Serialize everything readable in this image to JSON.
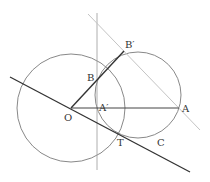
{
  "diagram": {
    "colors": {
      "thin_line": "#8a8a8a",
      "light_line": "#c4c4c4",
      "thick_line": "#333333",
      "circle": "#7a7a7a",
      "label": "#333333"
    },
    "points": {
      "O": {
        "label": "O",
        "x": 71,
        "y": 108
      },
      "A": {
        "label": "A",
        "x": 179,
        "y": 108
      },
      "A_prime": {
        "label": "A′",
        "x": 97,
        "y": 108
      },
      "B": {
        "label": "B",
        "x": 97,
        "y": 80
      },
      "B_prime": {
        "label": "B′",
        "x": 124,
        "y": 51
      },
      "T": {
        "label": "T",
        "x": 118,
        "y": 132
      },
      "C": {
        "label": "C"
      }
    },
    "circles": [
      {
        "name": "circle-O",
        "cx": 71,
        "cy": 108,
        "r": 54
      },
      {
        "name": "circle-C",
        "cx": 138,
        "cy": 95,
        "r": 43
      }
    ],
    "lines": [
      {
        "name": "tangent-line-OT",
        "x1": 10,
        "y1": 77,
        "x2": 190,
        "y2": 172
      },
      {
        "name": "line-B-prime-A",
        "x1": 88,
        "y1": 14,
        "x2": 200,
        "y2": 130
      },
      {
        "name": "vertical-line-A-prime",
        "x1": 97,
        "y1": 13,
        "x2": 97,
        "y2": 170
      },
      {
        "name": "segment-OA",
        "x1": 71,
        "y1": 108,
        "x2": 179,
        "y2": 108
      },
      {
        "name": "segment-OB-prime",
        "x1": 71,
        "y1": 108,
        "x2": 124,
        "y2": 51
      }
    ]
  }
}
